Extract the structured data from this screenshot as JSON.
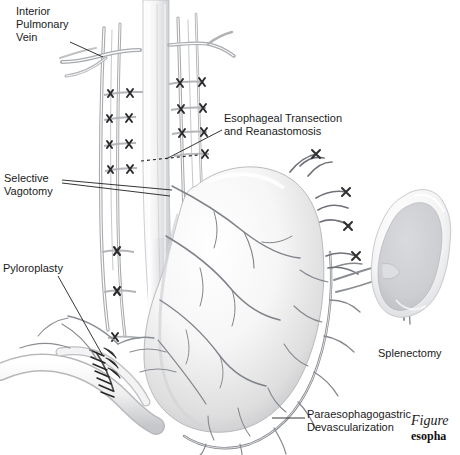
{
  "figure": {
    "title_italic": "Figure",
    "title_bold": "esopha",
    "background_color": "#ffffff",
    "ink_color": "#1b1b1b",
    "vessel_color": "#8a8d92",
    "organ_fill": "#f2f2f3",
    "organ_shadow": "#c9cacd",
    "clip_color": "#2a2a2a"
  },
  "labels": {
    "inferior_pulmonary_vein": "Interior\nPulmonary\nVein",
    "esophageal_transection": "Esophageal Transection\nand Reanastomosis",
    "selective_vagotomy": "Selective\nVagotomy",
    "pyloroplasty": "Pyloroplasty",
    "splenectomy": "Splenectomy",
    "paraesophagogastric": "Paraesophagogastric\nDevascularization"
  },
  "structures": {
    "esophagus": "esophagus",
    "stomach": "stomach",
    "spleen": "spleen",
    "duodenum": "duodenum",
    "pyloroplasty_suture_line": "pyloroplasty-suture-line",
    "transection_dashed_line": "esophageal-transection-dashed-line",
    "ligature_clip_count": 22,
    "vagotomy_leader_lines": 2
  }
}
